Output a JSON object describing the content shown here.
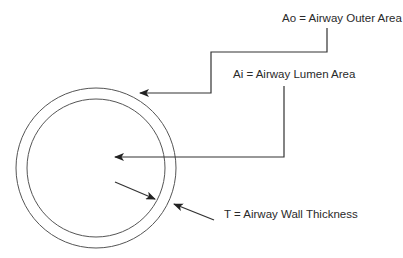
{
  "diagram": {
    "type": "airway-cross-section",
    "labels": {
      "ao": "Ao = Airway Outer Area",
      "ai": "Ai = Airway Lumen Area",
      "t": "T = Airway Wall Thickness"
    },
    "colors": {
      "line": "#333333",
      "circle": "#555555",
      "text": "#2a2a2a",
      "background": "#ffffff"
    },
    "shapes": {
      "outer_circle": {
        "cx": 96,
        "cy": 168,
        "r": 80
      },
      "inner_circle": {
        "cx": 96,
        "cy": 168,
        "r": 69
      }
    },
    "arrows": [
      {
        "name": "ao-arrow",
        "points": "327,28 327,52 211,52 211,93 140,93"
      },
      {
        "name": "ai-arrow",
        "points": "284,86 284,157 115,157"
      },
      {
        "name": "t-inner-arrow",
        "points": "115,182 155,199"
      },
      {
        "name": "t-outer-arrow",
        "points": "214,220 174,204"
      }
    ]
  }
}
